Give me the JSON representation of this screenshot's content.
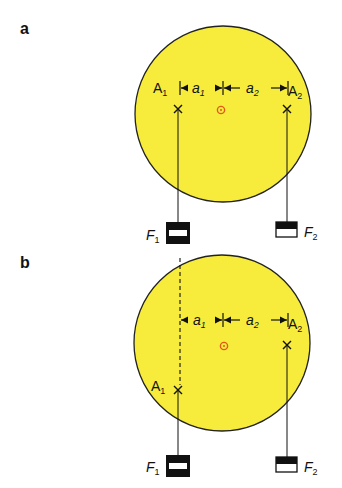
{
  "colors": {
    "disk_fill": "#f7ec3c",
    "disk_stroke": "#222222",
    "axis_marker": "#e05a1a",
    "line": "#111111"
  },
  "panels": [
    {
      "label": "a",
      "point_1": {
        "name": "A",
        "sub": "1"
      },
      "point_2": {
        "name": "A",
        "sub": "2"
      },
      "arm_1": {
        "name": "a",
        "sub": "1"
      },
      "arm_2": {
        "name": "a",
        "sub": "2"
      },
      "force_1": {
        "name": "F",
        "sub": "1"
      },
      "force_2": {
        "name": "F",
        "sub": "2"
      }
    },
    {
      "label": "b",
      "point_1": {
        "name": "A",
        "sub": "1"
      },
      "point_2": {
        "name": "A",
        "sub": "2"
      },
      "arm_1": {
        "name": "a",
        "sub": "1"
      },
      "arm_2": {
        "name": "a",
        "sub": "2"
      },
      "force_1": {
        "name": "F",
        "sub": "1"
      },
      "force_2": {
        "name": "F",
        "sub": "2"
      }
    }
  ]
}
